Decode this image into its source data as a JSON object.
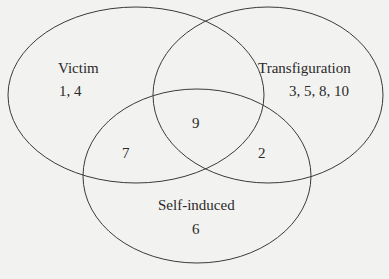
{
  "diagram": {
    "type": "venn",
    "sets": [
      {
        "name": "Victim",
        "only": "1, 4"
      },
      {
        "name": "Transfiguration",
        "only": "3, 5, 8, 10"
      },
      {
        "name": "Self-induced",
        "only": "6"
      }
    ],
    "intersections": {
      "victim_transfiguration_selfinduced": "9",
      "victim_selfinduced": "7",
      "transfiguration_selfinduced": "2"
    },
    "colors": {
      "stroke": "#3a3a3a",
      "background": "#f2f2f0"
    }
  }
}
